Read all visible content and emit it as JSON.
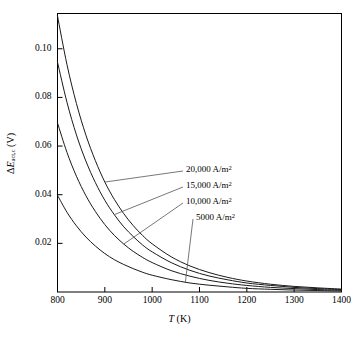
{
  "chart_data": {
    "type": "line",
    "title": "",
    "xlabel": "T (K)",
    "ylabel": "ΔE_act,c (V)",
    "xlim": [
      800,
      1400
    ],
    "ylim": [
      0,
      0.1145
    ],
    "grid": false,
    "legend_position": "inside-right-annotations",
    "xticks": [
      800,
      900,
      1000,
      1100,
      1200,
      1300,
      1400
    ],
    "xtick_labels": [
      "800",
      "900",
      "1000",
      "1100",
      "1200",
      "1300",
      "1400"
    ],
    "yticks": [
      0.02,
      0.04,
      0.06,
      0.08,
      0.1
    ],
    "ytick_labels": [
      "0.02",
      "0.04",
      "0.06",
      "0.08",
      "0.10"
    ],
    "series": [
      {
        "name": "20,000 A/m2",
        "label": "20,000 A/m",
        "label_sup": "2",
        "x": [
          800,
          820,
          840,
          860,
          880,
          900,
          920,
          940,
          960,
          980,
          1000,
          1040,
          1080,
          1120,
          1160,
          1200,
          1250,
          1300,
          1350,
          1400
        ],
        "y": [
          0.1135,
          0.0935,
          0.0775,
          0.0645,
          0.054,
          0.0452,
          0.0381,
          0.0322,
          0.0273,
          0.0232,
          0.0198,
          0.0145,
          0.0107,
          0.008,
          0.006,
          0.0045,
          0.0032,
          0.0023,
          0.0017,
          0.0012
        ]
      },
      {
        "name": "15,000 A/m2",
        "label": "15,000 A/m",
        "label_sup": "2",
        "x": [
          800,
          820,
          840,
          860,
          880,
          900,
          920,
          940,
          960,
          980,
          1000,
          1040,
          1080,
          1120,
          1160,
          1200,
          1250,
          1300,
          1350,
          1400
        ],
        "y": [
          0.0945,
          0.078,
          0.0646,
          0.0538,
          0.045,
          0.0377,
          0.0318,
          0.0268,
          0.0228,
          0.0193,
          0.0165,
          0.0121,
          0.0089,
          0.0066,
          0.005,
          0.0037,
          0.0027,
          0.0019,
          0.0014,
          0.001
        ]
      },
      {
        "name": "10,000 A/m2",
        "label": "10,000 A/m",
        "label_sup": "2",
        "x": [
          800,
          820,
          840,
          860,
          880,
          900,
          920,
          940,
          960,
          980,
          1000,
          1040,
          1080,
          1120,
          1160,
          1200,
          1250,
          1300,
          1350,
          1400
        ],
        "y": [
          0.0695,
          0.0574,
          0.0476,
          0.0396,
          0.0331,
          0.0277,
          0.0233,
          0.0197,
          0.0167,
          0.0142,
          0.0121,
          0.0088,
          0.0065,
          0.0048,
          0.0036,
          0.0027,
          0.0019,
          0.0014,
          0.001,
          0.0007
        ]
      },
      {
        "name": "5000 A/m2",
        "label": "5000 A/m",
        "label_sup": "2",
        "x": [
          800,
          820,
          840,
          860,
          880,
          900,
          920,
          940,
          960,
          980,
          1000,
          1040,
          1080,
          1120,
          1160,
          1200,
          1250,
          1300,
          1350,
          1400
        ],
        "y": [
          0.0398,
          0.0328,
          0.0272,
          0.0226,
          0.0189,
          0.0158,
          0.0133,
          0.0113,
          0.0096,
          0.0081,
          0.0069,
          0.0051,
          0.0037,
          0.0028,
          0.0021,
          0.0015,
          0.0011,
          0.0008,
          0.0006,
          0.0004
        ]
      }
    ],
    "annotations": [
      {
        "text": "20,000 A/m2",
        "leader_from_x": 900,
        "leader_from_y": 0.0452
      },
      {
        "text": "15,000 A/m2",
        "leader_from_x": 920,
        "leader_from_y": 0.0318
      },
      {
        "text": "10,000 A/m2",
        "leader_from_x": 940,
        "leader_from_y": 0.0197
      },
      {
        "text": "5000 A/m2",
        "leader_from_x": 1070,
        "leader_from_y": 0.0038
      }
    ],
    "line_color": "#1a1a1a",
    "axis_color": "#000000"
  },
  "axes": {
    "x_title_main": "T",
    "x_title_unit": " (K)",
    "y_title_delta": "ΔE",
    "y_title_sub": "act,c",
    "y_title_unit": " (V)"
  },
  "legend": {
    "items": [
      {
        "value": "20,000 A/m",
        "exp": "2"
      },
      {
        "value": "15,000 A/m",
        "exp": "2"
      },
      {
        "value": "10,000 A/m",
        "exp": "2"
      },
      {
        "value": "5000 A/m",
        "exp": "2"
      }
    ]
  }
}
